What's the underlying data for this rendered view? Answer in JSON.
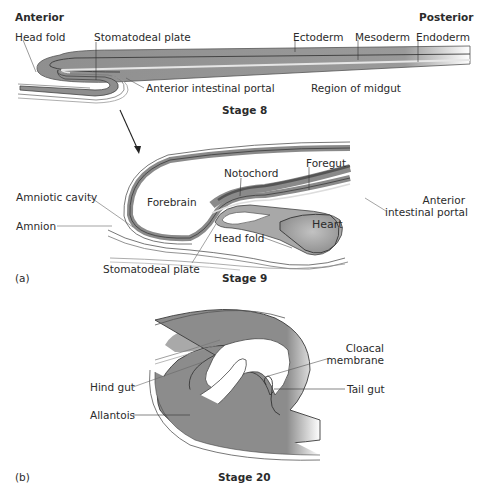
{
  "figure": {
    "panel_a": {
      "tag": "(a)",
      "stage8": {
        "caption": "Stage 8",
        "orientation_left": "Anterior",
        "orientation_right": "Posterior",
        "labels": {
          "head_fold": "Head fold",
          "stomatodeal_plate": "Stomatodeal plate",
          "ectoderm": "Ectoderm",
          "mesoderm": "Mesoderm",
          "endoderm": "Endoderm",
          "anterior_intestinal_portal": "Anterior intestinal portal",
          "region_of_midgut": "Region of midgut"
        }
      },
      "stage9": {
        "caption": "Stage 9",
        "labels": {
          "amniotic_cavity": "Amniotic cavity",
          "amnion": "Amnion",
          "forebrain": "Forebrain",
          "notochord": "Notochord",
          "foregut": "Foregut",
          "anterior_intestinal_portal_line1": "Anterior",
          "anterior_intestinal_portal_line2": "intestinal portal",
          "heart": "Heart",
          "head_fold": "Head fold",
          "stomatodeal_plate": "Stomatodeal plate"
        }
      }
    },
    "panel_b": {
      "tag": "(b)",
      "stage20": {
        "caption": "Stage 20",
        "labels": {
          "cloacal_membrane_line1": "Cloacal",
          "cloacal_membrane_line2": "membrane",
          "hind_gut": "Hind gut",
          "tail_gut": "Tail gut",
          "allantois": "Allantois"
        }
      }
    },
    "colors": {
      "tissue_dark": "#8c8c8c",
      "tissue_mid": "#a6a6a6",
      "tissue_light": "#c8c8c8",
      "outline": "#3a3a3a",
      "leader_line": "#6b6b6b",
      "background": "#ffffff"
    }
  }
}
